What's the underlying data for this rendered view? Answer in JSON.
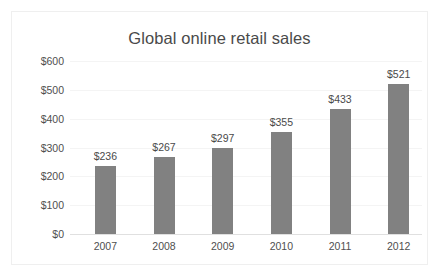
{
  "chart_data": {
    "type": "bar",
    "title": "Global online retail sales",
    "xlabel": "",
    "ylabel": "",
    "categories": [
      "2007",
      "2008",
      "2009",
      "2010",
      "2011",
      "2012"
    ],
    "values": [
      236,
      267,
      297,
      355,
      433,
      521
    ],
    "value_labels": [
      "$236",
      "$267",
      "$297",
      "$355",
      "$433",
      "$521"
    ],
    "ylim": [
      0,
      600
    ],
    "ytick_values": [
      600,
      500,
      400,
      300,
      200,
      100,
      0
    ],
    "ytick_labels": [
      "$600",
      "$500",
      "$400",
      "$300",
      "$200",
      "$100",
      "$0"
    ],
    "grid": true,
    "legend": null,
    "series_color": "#818181",
    "title_color": "#4a4a4a",
    "tick_color": "#4f4f4f",
    "gridline_color": "#f4f4f4",
    "border_color": "#efefef",
    "background": "#ffffff"
  }
}
